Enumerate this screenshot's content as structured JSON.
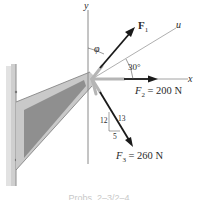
{
  "figure": {
    "axes": {
      "x_label": "x",
      "y_label": "y",
      "u_label": "u"
    },
    "forces": {
      "f1": {
        "name": "F",
        "sub": "1"
      },
      "f2": {
        "name": "F",
        "sub": "2",
        "value": "= 200 N"
      },
      "f3": {
        "name": "F",
        "sub": "3",
        "value": "= 260 N"
      }
    },
    "angles": {
      "phi": "φ",
      "u_angle": "30°"
    },
    "slope_triangle": {
      "vertical": "12",
      "hypotenuse": "13",
      "horizontal": "5"
    },
    "caption": "Probs. 2–3/2–4",
    "colors": {
      "arrow": "#1a1a1a",
      "axis": "#8a8a8a",
      "bracket_fill": "#9a9a9a",
      "bracket_edge": "#c4c4c4",
      "wall": "#d8d8d8"
    }
  }
}
